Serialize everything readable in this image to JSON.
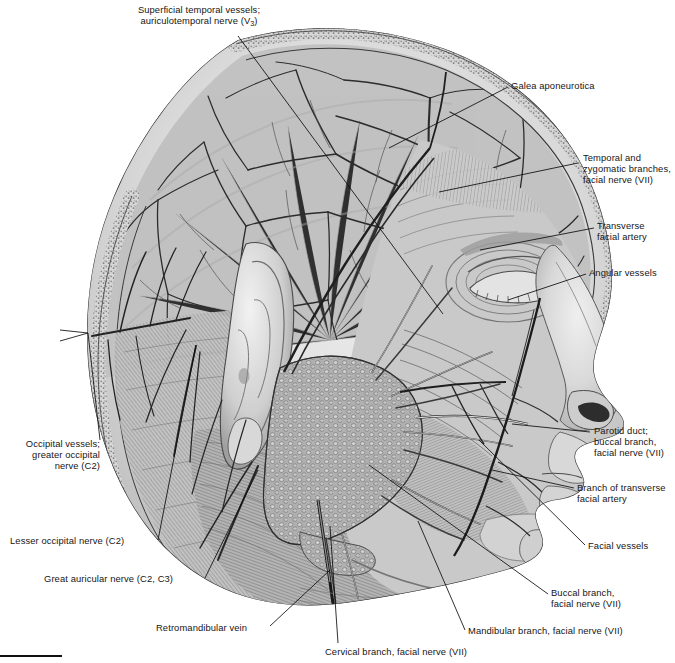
{
  "figure": {
    "background_color": "#ffffff",
    "ink_color": "#161616"
  },
  "labels": [
    {
      "id": "superficial-temporal",
      "line1": "Superficial temporal vessels;",
      "line2": "auriculotemporal nerve (V",
      "sub": "3",
      "line2_tail": ")",
      "align": "center",
      "x": 104,
      "y": 4,
      "w": 190
    },
    {
      "id": "galea-aponeurotica",
      "text": "Galea aponeurotica",
      "align": "left",
      "x": 511,
      "y": 80,
      "w": 145
    },
    {
      "id": "temporal-zygomatic-branches",
      "text": "Temporal and\nzygomatic branches,\nfacial nerve (VII)",
      "align": "left",
      "x": 583,
      "y": 152,
      "w": 90
    },
    {
      "id": "transverse-facial-artery",
      "text": "Transverse\nfacial artery",
      "align": "left",
      "x": 597,
      "y": 220,
      "w": 80
    },
    {
      "id": "angular-vessels",
      "text": "Angular vessels",
      "align": "left",
      "x": 589,
      "y": 267,
      "w": 85
    },
    {
      "id": "parotid-duct-buccal-branch",
      "text": "Parotid duct;\nbuccal branch,\nfacial nerve (VII)",
      "align": "left",
      "x": 594,
      "y": 425,
      "w": 80
    },
    {
      "id": "branch-transverse-facial-artery",
      "text": "Branch of transverse\nfacial artery",
      "align": "left",
      "x": 577,
      "y": 482,
      "w": 95
    },
    {
      "id": "facial-vessels",
      "text": "Facial vessels",
      "align": "left",
      "x": 588,
      "y": 540,
      "w": 80
    },
    {
      "id": "buccal-branch",
      "text": "Buccal branch,\nfacial nerve (VII)",
      "align": "left",
      "x": 551,
      "y": 587,
      "w": 88
    },
    {
      "id": "mandibular-branch",
      "text": "Mandibular branch, facial nerve (VII)",
      "align": "left",
      "x": 468,
      "y": 625,
      "w": 200
    },
    {
      "id": "cervical-branch",
      "text": "Cervical branch, facial nerve (VII)",
      "align": "left",
      "x": 325,
      "y": 646,
      "w": 190
    },
    {
      "id": "retromandibular-vein",
      "text": "Retromandibular vein",
      "align": "left",
      "x": 156,
      "y": 622,
      "w": 110
    },
    {
      "id": "great-auricular-nerve",
      "text": "Great auricular nerve (C2, C3)",
      "align": "left",
      "x": 44,
      "y": 573,
      "w": 160
    },
    {
      "id": "lesser-occipital-nerve",
      "text": "Lesser occipital nerve (C2)",
      "align": "left",
      "x": 10,
      "y": 535,
      "w": 145
    },
    {
      "id": "occipital-vessels",
      "text": "Occipital vessels;\ngreater occipital\nnerve (C2)",
      "align": "right",
      "x": 8,
      "y": 438,
      "w": 90
    }
  ],
  "leaders": [
    {
      "id": "leader-superficial-temporal",
      "points": "238,36 443,314"
    },
    {
      "id": "leader-galea",
      "points": "508,87 389,148"
    },
    {
      "id": "leader-temporal-zygomatic",
      "points": "578,163 439,192"
    },
    {
      "id": "leader-transverse-facial",
      "points": "594,228 480,250"
    },
    {
      "id": "leader-angular",
      "points": "586,274 508,300"
    },
    {
      "id": "leader-parotid-duct",
      "points": "590,432 512,424"
    },
    {
      "id": "leader-branch-transverse",
      "points": "574,488 492,470"
    },
    {
      "id": "leader-facial-vessels",
      "points": "585,545 479,440"
    },
    {
      "id": "leader-buccal-branch",
      "points": "548,594 369,465"
    },
    {
      "id": "leader-mandibular-branch",
      "points": "465,630 418,521"
    },
    {
      "id": "leader-cervical-branch",
      "points": "338,643 330,526"
    },
    {
      "id": "leader-retromandibular",
      "points": "270,626 330,570"
    },
    {
      "id": "leader-great-auricular",
      "points": "205,578 258,470"
    },
    {
      "id": "leader-lesser-occipital",
      "points": "158,540 196,345"
    },
    {
      "id": "leader-occipital-vessels",
      "points": "100,440 88,333"
    },
    {
      "id": "leader-occipital-branch-a",
      "points": "88,333 60,340"
    },
    {
      "id": "leader-occipital-branch-b",
      "points": "88,333 60,331"
    }
  ],
  "footer": {
    "rule_color": "#111111",
    "visible": true
  }
}
